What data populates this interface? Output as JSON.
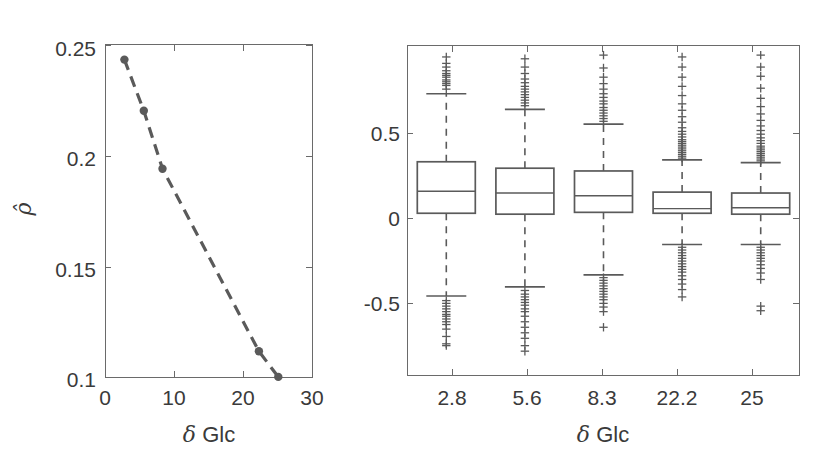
{
  "figure": {
    "width": 829,
    "height": 464,
    "background": "#ffffff",
    "ink_color": "#5a5a5a",
    "text_color": "#3a3a3a"
  },
  "chart_data": [
    {
      "id": "left-panel",
      "type": "line",
      "title": "",
      "xlabel": "δ Glc",
      "ylabel": "ρ̂",
      "xlim": [
        0,
        30
      ],
      "ylim": [
        0.1,
        0.25
      ],
      "xticks": [
        0,
        10,
        20,
        30
      ],
      "xticklabels": [
        "0",
        "10",
        "20",
        "30"
      ],
      "yticks": [
        0.1,
        0.15,
        0.2,
        0.25
      ],
      "yticklabels": [
        "0.1",
        "0.15",
        "0.2",
        "0.25"
      ],
      "grid": false,
      "legend": null,
      "series": [
        {
          "name": "rho-hat",
          "linestyle": "dashed",
          "marker": "filled-circle",
          "color": "#5a5a5a",
          "x": [
            2.8,
            5.6,
            8.3,
            22.2,
            25.0
          ],
          "y": [
            0.243,
            0.22,
            0.194,
            0.112,
            0.1005
          ]
        }
      ]
    },
    {
      "id": "right-panel",
      "type": "boxplot",
      "title": "",
      "xlabel": "δ Glc",
      "ylabel": "",
      "ylim": [
        -0.88,
        0.92
      ],
      "yticks": [
        -0.5,
        0,
        0.5
      ],
      "yticklabels": [
        "-0.5",
        "0",
        "0.5"
      ],
      "categories": [
        "2.8",
        "5.6",
        "8.3",
        "22.2",
        "25"
      ],
      "grid": false,
      "legend": null,
      "boxes": [
        {
          "category": "2.8",
          "q1": 0.005,
          "median": 0.125,
          "q3": 0.285,
          "whisker_low": -0.445,
          "whisker_high": 0.655,
          "outliers_high": [
            0.68,
            0.7,
            0.71,
            0.72,
            0.73,
            0.745,
            0.755,
            0.765,
            0.78,
            0.8,
            0.82,
            0.855
          ],
          "outliers_low": [
            -0.47,
            -0.485,
            -0.5,
            -0.515,
            -0.53,
            -0.545,
            -0.555,
            -0.57,
            -0.585,
            -0.6,
            -0.625,
            -0.665,
            -0.705,
            -0.715
          ]
        },
        {
          "category": "5.6",
          "q1": 0.0,
          "median": 0.115,
          "q3": 0.25,
          "whisker_low": -0.395,
          "whisker_high": 0.57,
          "outliers_high": [
            0.59,
            0.605,
            0.62,
            0.635,
            0.65,
            0.665,
            0.68,
            0.695,
            0.715,
            0.735,
            0.765,
            0.8,
            0.845
          ],
          "outliers_low": [
            -0.415,
            -0.435,
            -0.45,
            -0.465,
            -0.48,
            -0.495,
            -0.515,
            -0.53,
            -0.555,
            -0.585,
            -0.615,
            -0.645,
            -0.675,
            -0.715,
            -0.745
          ]
        },
        {
          "category": "8.3",
          "q1": 0.01,
          "median": 0.1,
          "q3": 0.235,
          "whisker_low": -0.33,
          "whisker_high": 0.49,
          "outliers_high": [
            0.505,
            0.52,
            0.535,
            0.55,
            0.565,
            0.58,
            0.6,
            0.615,
            0.635,
            0.655,
            0.68,
            0.71,
            0.745,
            0.795,
            0.865
          ],
          "outliers_low": [
            -0.345,
            -0.36,
            -0.375,
            -0.39,
            -0.405,
            -0.42,
            -0.435,
            -0.45,
            -0.465,
            -0.485,
            -0.505,
            -0.53,
            -0.615
          ]
        },
        {
          "category": "22.2",
          "q1": 0.005,
          "median": 0.03,
          "q3": 0.12,
          "whisker_low": -0.165,
          "whisker_high": 0.295,
          "outliers_high": [
            0.305,
            0.315,
            0.325,
            0.335,
            0.345,
            0.355,
            0.365,
            0.375,
            0.385,
            0.395,
            0.405,
            0.42,
            0.435,
            0.45,
            0.47,
            0.5,
            0.53,
            0.565,
            0.6,
            0.645,
            0.695,
            0.745,
            0.8,
            0.855
          ],
          "outliers_low": [
            -0.18,
            -0.195,
            -0.21,
            -0.225,
            -0.24,
            -0.255,
            -0.27,
            -0.285,
            -0.3,
            -0.315,
            -0.335,
            -0.355,
            -0.38,
            -0.41,
            -0.45
          ]
        },
        {
          "category": "25",
          "q1": 0.0,
          "median": 0.035,
          "q3": 0.115,
          "whisker_low": -0.165,
          "whisker_high": 0.28,
          "outliers_high": [
            0.29,
            0.3,
            0.31,
            0.32,
            0.33,
            0.34,
            0.35,
            0.36,
            0.37,
            0.385,
            0.4,
            0.415,
            0.435,
            0.455,
            0.48,
            0.51,
            0.545,
            0.585,
            0.63,
            0.685,
            0.75,
            0.8,
            0.865
          ],
          "outliers_low": [
            -0.18,
            -0.195,
            -0.21,
            -0.225,
            -0.24,
            -0.255,
            -0.275,
            -0.295,
            -0.32,
            -0.355,
            -0.5,
            -0.525
          ]
        }
      ],
      "box_style": {
        "outlier_marker": "plus",
        "whisker_linestyle": "dashed",
        "edge_color": "#5a5a5a"
      }
    }
  ],
  "left_panel": {
    "name": "rho-hat-vs-delta-glc",
    "xlabel": "δ Glc",
    "ylabel": "ρ̂",
    "ytick_labels": [
      "0.25",
      "0.2",
      "0.15",
      "0.1"
    ],
    "xtick_labels": [
      "0",
      "10",
      "20",
      "30"
    ]
  },
  "right_panel": {
    "name": "residual-boxplots-by-delta-glc",
    "xlabel": "δ Glc",
    "ytick_labels": [
      "0.5",
      "0",
      "-0.5"
    ],
    "xtick_labels": [
      "2.8",
      "5.6",
      "8.3",
      "22.2",
      "25"
    ]
  }
}
